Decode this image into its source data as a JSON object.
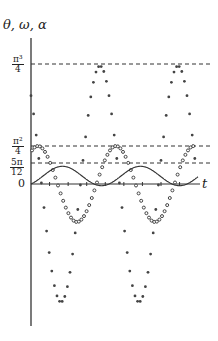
{
  "chart_data": {
    "type": "scatter",
    "title": "",
    "ylabel": "θ, ω, α",
    "xlabel": "t",
    "grid": false,
    "reference_lines": [
      {
        "label_num": "π³",
        "label_den": "4",
        "value": 7.75
      },
      {
        "label_num": "π²",
        "label_den": "4",
        "value": 2.47
      },
      {
        "label_num": "5π",
        "label_den": "12",
        "value": 1.31
      }
    ],
    "y_tick_zero": "0",
    "series": [
      {
        "name": "θ",
        "style": "solid-line",
        "description": "sinusoid oscillating between about -0.3 and 5π/12, starting at 0"
      },
      {
        "name": "ω",
        "style": "open-circles",
        "description": "sinusoid oscillating between about -2.4 and π²/4"
      },
      {
        "name": "α",
        "style": "filled-dots",
        "description": "large-amplitude sinusoid oscillating between about -7.7 and π³/4"
      }
    ],
    "period_px": 78,
    "ylim": [
      -7.75,
      7.75
    ]
  },
  "axis": {
    "y_label": "θ, ω, α",
    "t_label": "t",
    "zero_label": "0"
  },
  "ref": {
    "a_num": "π³",
    "a_den": "4",
    "b_num": "π²",
    "b_den": "4",
    "c_num": "5π",
    "c_den": "12"
  }
}
